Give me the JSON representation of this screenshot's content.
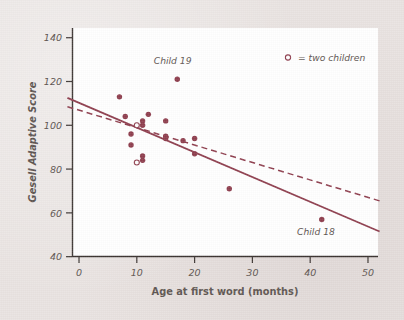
{
  "chart_data": {
    "type": "scatter",
    "title": "",
    "xlabel": "Age at first word (months)",
    "ylabel": "Gesell Adaptive Score",
    "xlim": [
      -2,
      52
    ],
    "ylim": [
      38,
      146
    ],
    "xticks": [
      0,
      10,
      20,
      30,
      40,
      50
    ],
    "yticks": [
      40,
      60,
      80,
      100,
      120,
      140
    ],
    "xtick_labels": [
      "0",
      "10",
      "20",
      "30",
      "40",
      "50"
    ],
    "ytick_labels": [
      "40",
      "60",
      "80",
      "100",
      "120",
      "140"
    ],
    "grid": false,
    "legend_position": "top-right",
    "legend": [
      {
        "marker": "open-circle",
        "label": "= two children"
      }
    ],
    "points": [
      {
        "x": 7,
        "y": 113,
        "marker": "filled",
        "n": 1
      },
      {
        "x": 8,
        "y": 104,
        "marker": "filled",
        "n": 1
      },
      {
        "x": 9,
        "y": 96,
        "marker": "filled",
        "n": 1
      },
      {
        "x": 9,
        "y": 91,
        "marker": "filled",
        "n": 1
      },
      {
        "x": 10,
        "y": 100,
        "marker": "open",
        "n": 2
      },
      {
        "x": 10,
        "y": 83,
        "marker": "open",
        "n": 2
      },
      {
        "x": 11,
        "y": 102,
        "marker": "filled",
        "n": 1
      },
      {
        "x": 11,
        "y": 100,
        "marker": "filled",
        "n": 1
      },
      {
        "x": 11,
        "y": 86,
        "marker": "filled",
        "n": 1
      },
      {
        "x": 11,
        "y": 84,
        "marker": "filled",
        "n": 1
      },
      {
        "x": 12,
        "y": 105,
        "marker": "filled",
        "n": 1
      },
      {
        "x": 15,
        "y": 102,
        "marker": "filled",
        "n": 1
      },
      {
        "x": 15,
        "y": 95,
        "marker": "filled",
        "n": 1
      },
      {
        "x": 15,
        "y": 94,
        "marker": "filled",
        "n": 1
      },
      {
        "x": 17,
        "y": 121,
        "marker": "filled",
        "n": 1,
        "label": "Child 19"
      },
      {
        "x": 18,
        "y": 93,
        "marker": "filled",
        "n": 1
      },
      {
        "x": 20,
        "y": 94,
        "marker": "filled",
        "n": 1
      },
      {
        "x": 20,
        "y": 87,
        "marker": "filled",
        "n": 1
      },
      {
        "x": 26,
        "y": 71,
        "marker": "filled",
        "n": 1
      },
      {
        "x": 42,
        "y": 57,
        "marker": "filled",
        "n": 1,
        "label": "Child 18"
      }
    ],
    "annotations": [
      {
        "text": "Child 19",
        "x": 16.2,
        "y": 128,
        "anchor": "middle"
      },
      {
        "text": "Child 18",
        "x": 41.0,
        "y": 50,
        "anchor": "middle"
      }
    ],
    "series": [
      {
        "name": "regression-all-data",
        "type": "line",
        "style": "solid",
        "x": [
          -2,
          52
        ],
        "y": [
          112.5,
          51.5
        ]
      },
      {
        "name": "regression-without-child-18",
        "type": "line",
        "style": "dashed",
        "x": [
          -2,
          52
        ],
        "y": [
          108.5,
          65.5
        ]
      }
    ],
    "colors": {
      "marker": "#8e3d4d",
      "line": "#8e3d4d",
      "axis": "#3a3330",
      "text": "#5d5450",
      "plot_background": "#ffffff",
      "page_background": "#e9e3e1"
    }
  }
}
